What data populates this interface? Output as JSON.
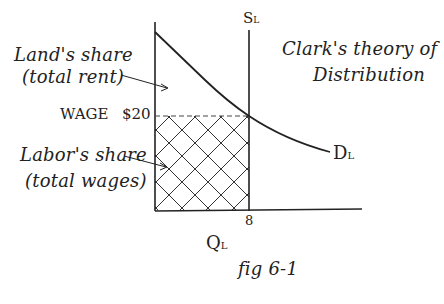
{
  "figure": {
    "title_line1": "Clark's theory of",
    "title_line2": "Distribution",
    "caption": "fig 6-1"
  },
  "labels": {
    "land_share_line1": "Land's share",
    "land_share_line2": "(total rent)",
    "labor_share_line1": "Labor's share",
    "labor_share_line2": "(total wages)",
    "wage_label": "WAGE",
    "wage_value": "$20",
    "supply_label": "S",
    "supply_sub": "L",
    "demand_label": "D",
    "demand_sub": "L",
    "x_axis_label": "Q",
    "x_axis_sub": "L",
    "x_tick": "8"
  },
  "colors": {
    "ink": "#222222",
    "background": "#ffffff"
  },
  "diagram_data": {
    "type": "supply-demand",
    "supply": {
      "name": "S_L",
      "kind": "vertical",
      "quantity": 8
    },
    "demand": {
      "name": "D_L",
      "kind": "downward-sloping curve"
    },
    "equilibrium": {
      "wage": 20,
      "quantity": 8
    },
    "regions": [
      {
        "name": "Land's share (total rent)",
        "area": "above wage, below demand"
      },
      {
        "name": "Labor's share (total wages)",
        "area": "below wage, left of supply",
        "fill": "crosshatch"
      }
    ]
  }
}
